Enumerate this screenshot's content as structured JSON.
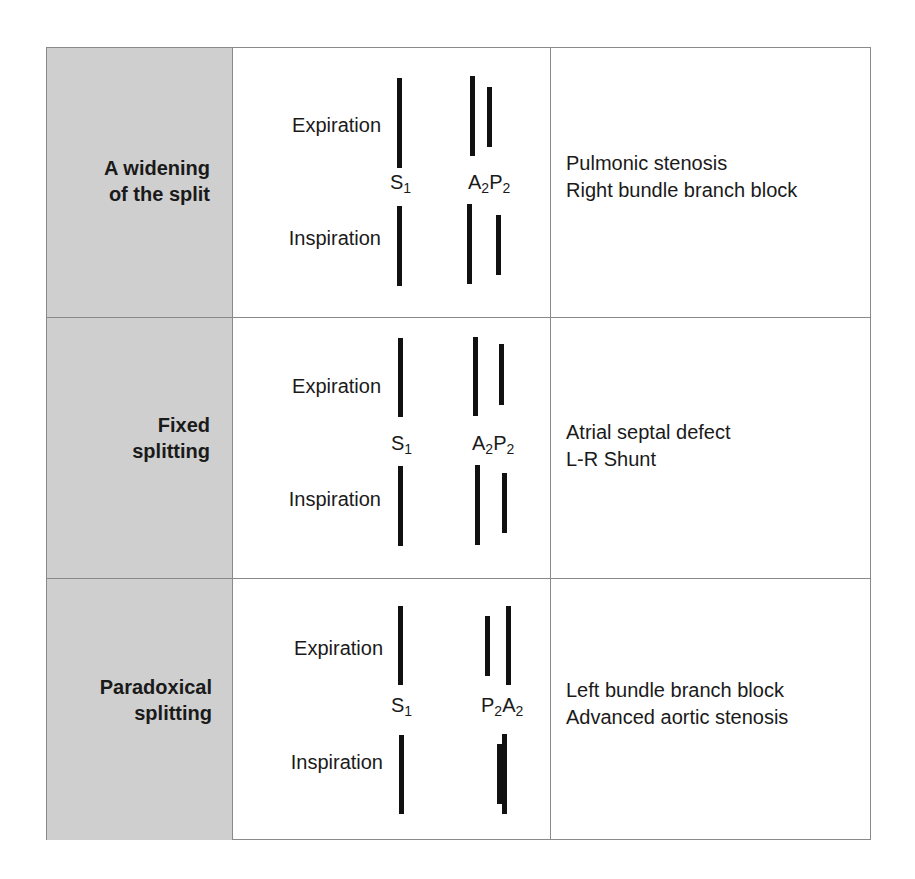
{
  "table": {
    "rows": [
      {
        "name_line1": "A widening",
        "name_line2": "of the split",
        "phase_expiration": "Expiration",
        "phase_inspiration": "Inspiration",
        "s1_label": "S",
        "s1_sub": "1",
        "second_label_a": "A",
        "second_sub_a": "2",
        "second_label_b": "P",
        "second_sub_b": "2",
        "second_sound_order": "A2P2",
        "condition_line1": "Pulmonic stenosis",
        "condition_line2": "Right bundle branch block"
      },
      {
        "name_line1": "Fixed",
        "name_line2": "splitting",
        "phase_expiration": "Expiration",
        "phase_inspiration": "Inspiration",
        "s1_label": "S",
        "s1_sub": "1",
        "second_label_a": "A",
        "second_sub_a": "2",
        "second_label_b": "P",
        "second_sub_b": "2",
        "second_sound_order": "A2P2",
        "condition_line1": "Atrial septal defect",
        "condition_line2": "L-R Shunt"
      },
      {
        "name_line1": "Paradoxical",
        "name_line2": "splitting",
        "phase_expiration": "Expiration",
        "phase_inspiration": "Inspiration",
        "s1_label": "S",
        "s1_sub": "1",
        "second_label_a": "P",
        "second_sub_a": "2",
        "second_label_b": "A",
        "second_sub_b": "2",
        "second_sound_order": "P2A2",
        "condition_line1": "Left bundle branch block",
        "condition_line2": "Advanced aortic stenosis"
      }
    ]
  },
  "colors": {
    "name_column_bg": "#cfcfcf",
    "border": "#8a8a8a",
    "bar": "#111111",
    "text": "#1a1a1a"
  }
}
